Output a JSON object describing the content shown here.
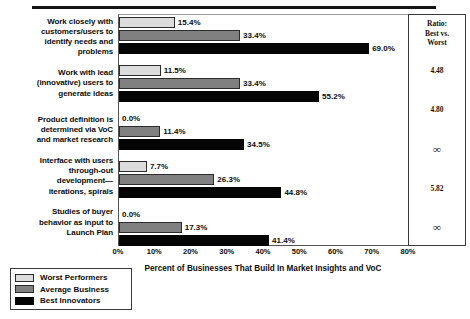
{
  "top_rule": true,
  "ratio_panel": {
    "header_lines": [
      "Ratio:",
      "Best vs.",
      "Worst"
    ],
    "values": [
      "4.48",
      "4.80",
      "∞",
      "5.82",
      "∞"
    ]
  },
  "legend": {
    "items": [
      {
        "label": "Worst Performers",
        "color": "#dcdcdc"
      },
      {
        "label": "Average Business",
        "color": "#808080"
      },
      {
        "label": "Best Innovators",
        "color": "#050505"
      }
    ]
  },
  "chart_data": {
    "type": "bar",
    "orientation": "horizontal",
    "title": "",
    "xlabel": "Percent of Businesses That Build In Market Insights and VoC",
    "ylabel": "",
    "xlim": [
      0,
      80
    ],
    "xticks": [
      0,
      10,
      20,
      30,
      40,
      50,
      60,
      70,
      80
    ],
    "xtick_labels": [
      "0%",
      "10%",
      "20%",
      "30%",
      "40%",
      "50%",
      "60%",
      "70%",
      "80%"
    ],
    "grid": false,
    "legend_position": "bottom-left",
    "categories": [
      "Work closely with customers/users to identify needs and problems",
      "Work with lead (innovative) users to generate ideas",
      "Product definition is determined via VoC and market research",
      "Interface with users through-out development—iterations, spirals",
      "Studies of buyer behavior as input to Launch Plan"
    ],
    "category_lines": [
      [
        "Work closely with",
        "customers/users to",
        "identify needs and",
        "problems"
      ],
      [
        "Work with lead",
        "(innovative) users to",
        "generate ideas"
      ],
      [
        "Product definition is",
        "determined via VoC",
        "and market research"
      ],
      [
        "Interface with users",
        "through-out",
        "development—",
        "iterations, spirals"
      ],
      [
        "Studies of buyer",
        "behavior as input to",
        "Launch Plan"
      ]
    ],
    "series": [
      {
        "name": "Worst Performers",
        "color": "#dcdcdc",
        "values": [
          15.4,
          11.5,
          0.0,
          7.7,
          0.0
        ],
        "labels": [
          "15.4%",
          "11.5%",
          "0.0%",
          "7.7%",
          "0.0%"
        ]
      },
      {
        "name": "Average Business",
        "color": "#808080",
        "values": [
          33.4,
          33.4,
          11.4,
          26.3,
          17.3
        ],
        "labels": [
          "33.4%",
          "33.4%",
          "11.4%",
          "26.3%",
          "17.3%"
        ]
      },
      {
        "name": "Best Innovators",
        "color": "#050505",
        "values": [
          69.0,
          55.2,
          34.5,
          44.8,
          41.4
        ],
        "labels": [
          "69.0%",
          "55.2%",
          "34.5%",
          "44.8%",
          "41.4%"
        ]
      }
    ],
    "ratio_best_vs_worst": [
      "4.48",
      "4.80",
      "∞",
      "5.82",
      "∞"
    ]
  }
}
